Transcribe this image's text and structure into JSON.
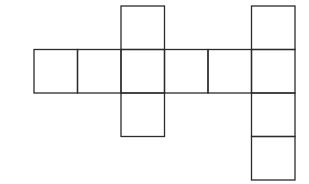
{
  "diagram": {
    "stroke_color": "#2b2b2b",
    "background": "#ffffff",
    "cell_size": 43.5,
    "origin": {
      "x": 34,
      "y": 6
    },
    "cells": [
      {
        "col": 2,
        "row": 0
      },
      {
        "col": 5,
        "row": 0
      },
      {
        "col": 0,
        "row": 1
      },
      {
        "col": 1,
        "row": 1
      },
      {
        "col": 2,
        "row": 1
      },
      {
        "col": 3,
        "row": 1
      },
      {
        "col": 4,
        "row": 1
      },
      {
        "col": 5,
        "row": 1
      },
      {
        "col": 2,
        "row": 2
      },
      {
        "col": 5,
        "row": 2
      },
      {
        "col": 5,
        "row": 3
      }
    ]
  }
}
